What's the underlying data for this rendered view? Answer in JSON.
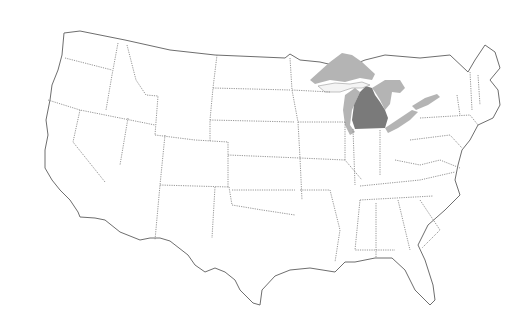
{
  "map": {
    "subject": "United States outline map",
    "highlighted_region": "Michigan",
    "secondary_region": "Great Lakes",
    "colors": {
      "background": "#ffffff",
      "state_border": "#8a8a8a",
      "coast": "#6e6e6e",
      "highlight": "#7a7a7a",
      "lakes": "#b4b4b4"
    }
  }
}
